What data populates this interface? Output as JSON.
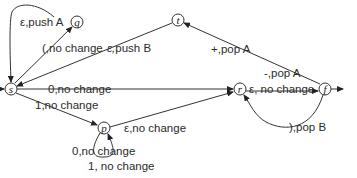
{
  "diagram": {
    "type": "pushdown-automaton",
    "states": [
      {
        "id": "s",
        "label": "s",
        "x": 11,
        "y": 89,
        "start": true
      },
      {
        "id": "q",
        "label": "q",
        "x": 77,
        "y": 22
      },
      {
        "id": "t",
        "label": "t",
        "x": 178,
        "y": 20
      },
      {
        "id": "p",
        "label": "p",
        "x": 104,
        "y": 128
      },
      {
        "id": "r",
        "label": "r",
        "x": 240,
        "y": 89
      },
      {
        "id": "f",
        "label": "f",
        "x": 325,
        "y": 89,
        "final": true
      }
    ],
    "transitions": [
      {
        "from": "q",
        "to": "s",
        "label": "ε,push A"
      },
      {
        "from": "s",
        "to": "q",
        "label": "(,no change"
      },
      {
        "from": "t",
        "to": "s",
        "label": "ε,push B"
      },
      {
        "from": "s",
        "to": "r",
        "label": "0,no change"
      },
      {
        "from": "s",
        "to": "p",
        "label": "1,no change"
      },
      {
        "from": "p",
        "to": "p",
        "label": "0,no change"
      },
      {
        "from": "p",
        "to": "p",
        "label": "1, no change"
      },
      {
        "from": "p",
        "to": "r",
        "label": "ε,no change"
      },
      {
        "from": "r",
        "to": "f",
        "label": "ε, no change"
      },
      {
        "from": "f",
        "to": "t",
        "label": "+,pop A"
      },
      {
        "from": "f",
        "to": "t",
        "label": "-,pop A"
      },
      {
        "from": "f",
        "to": "r",
        "label": "),pop B"
      }
    ],
    "labels": {
      "q_s": "ε,push A",
      "s_q": "(,no change",
      "t_s_eps": "ε,",
      "t_s_push": "push B",
      "s_r": "0,no change",
      "s_p": "1,no change",
      "p_loop0": "0,no change",
      "p_loop1": "1, no change",
      "p_r": "ε,no change",
      "r_f": "ε, no change",
      "f_t_plus": "+,pop A",
      "f_t_minus": "-,pop A",
      "f_r": "),pop B"
    },
    "state_labels": {
      "s": "s",
      "q": "q",
      "t": "t",
      "p": "p",
      "r": "r",
      "f": "f"
    }
  }
}
